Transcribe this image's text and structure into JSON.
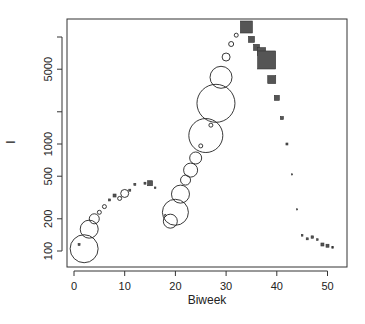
{
  "chart_data": {
    "type": "scatter",
    "title": "",
    "xlabel": "Biweek",
    "ylabel": "I",
    "xlim": [
      -1,
      53
    ],
    "ylim": [
      80,
      14000
    ],
    "y_scale": "log",
    "grid": false,
    "legend": null,
    "x_ticks": [
      0,
      10,
      20,
      30,
      40,
      50
    ],
    "x_tick_labels": [
      "0",
      "10",
      "20",
      "30",
      "40",
      "50"
    ],
    "y_ticks": [
      100,
      200,
      500,
      1000,
      2000,
      5000,
      10000
    ],
    "y_tick_labels": [
      "100",
      "200",
      "500",
      "1000",
      "",
      "5000",
      ""
    ],
    "series": [
      {
        "name": "circles",
        "marker": "open-circle",
        "points": [
          {
            "x": 2,
            "y": 105,
            "size": 14
          },
          {
            "x": 3,
            "y": 160,
            "size": 9
          },
          {
            "x": 4,
            "y": 200,
            "size": 5
          },
          {
            "x": 5,
            "y": 230,
            "size": 2
          },
          {
            "x": 6,
            "y": 260,
            "size": 2
          },
          {
            "x": 9,
            "y": 310,
            "size": 2
          },
          {
            "x": 10,
            "y": 345,
            "size": 4
          },
          {
            "x": 18,
            "y": 215,
            "size": 1
          },
          {
            "x": 19,
            "y": 190,
            "size": 7
          },
          {
            "x": 20,
            "y": 230,
            "size": 13
          },
          {
            "x": 21,
            "y": 340,
            "size": 9
          },
          {
            "x": 22,
            "y": 460,
            "size": 5
          },
          {
            "x": 23,
            "y": 570,
            "size": 7
          },
          {
            "x": 24,
            "y": 740,
            "size": 6
          },
          {
            "x": 25,
            "y": 960,
            "size": 2
          },
          {
            "x": 26,
            "y": 1200,
            "size": 17
          },
          {
            "x": 27,
            "y": 1500,
            "size": 2
          },
          {
            "x": 28,
            "y": 2400,
            "size": 19
          },
          {
            "x": 29,
            "y": 4200,
            "size": 11
          },
          {
            "x": 30,
            "y": 6500,
            "size": 4
          },
          {
            "x": 31,
            "y": 8600,
            "size": 2.5
          },
          {
            "x": 32,
            "y": 10400,
            "size": 2
          }
        ]
      },
      {
        "name": "squares",
        "marker": "filled-square",
        "points": [
          {
            "x": 1,
            "y": 115,
            "size": 1
          },
          {
            "x": 7,
            "y": 300,
            "size": 1
          },
          {
            "x": 8,
            "y": 330,
            "size": 1.5
          },
          {
            "x": 11,
            "y": 370,
            "size": 1
          },
          {
            "x": 12,
            "y": 420,
            "size": 1
          },
          {
            "x": 14,
            "y": 430,
            "size": 1
          },
          {
            "x": 15,
            "y": 430,
            "size": 2.5
          },
          {
            "x": 16,
            "y": 390,
            "size": 0.8
          },
          {
            "x": 34,
            "y": 12400,
            "size": 6
          },
          {
            "x": 35,
            "y": 9500,
            "size": 3
          },
          {
            "x": 36,
            "y": 8000,
            "size": 3
          },
          {
            "x": 37,
            "y": 7300,
            "size": 4
          },
          {
            "x": 38,
            "y": 6100,
            "size": 9
          },
          {
            "x": 39,
            "y": 4000,
            "size": 4
          },
          {
            "x": 40,
            "y": 2700,
            "size": 2.5
          },
          {
            "x": 41,
            "y": 1750,
            "size": 1.5
          },
          {
            "x": 42,
            "y": 1000,
            "size": 1
          },
          {
            "x": 43,
            "y": 520,
            "size": 0.6
          },
          {
            "x": 44,
            "y": 245,
            "size": 0.6
          },
          {
            "x": 45,
            "y": 140,
            "size": 0.8
          },
          {
            "x": 46,
            "y": 130,
            "size": 1
          },
          {
            "x": 47,
            "y": 135,
            "size": 1.2
          },
          {
            "x": 48,
            "y": 128,
            "size": 0.8
          },
          {
            "x": 49,
            "y": 115,
            "size": 1.5
          },
          {
            "x": 50,
            "y": 112,
            "size": 1.5
          },
          {
            "x": 51,
            "y": 108,
            "size": 0.8
          }
        ]
      }
    ],
    "colors": {
      "circle_stroke": "#222222",
      "square_fill": "#555555",
      "square_stroke": "#333333"
    }
  }
}
